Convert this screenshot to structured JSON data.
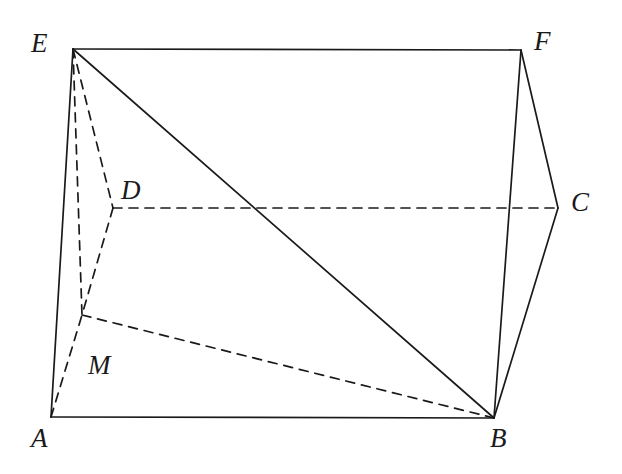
{
  "figure": {
    "type": "geometry-diagram",
    "canvas": {
      "width": 622,
      "height": 474,
      "background": "#ffffff"
    },
    "stroke_color": "#1a1a1a",
    "solid_stroke_width": 1.7,
    "dashed_stroke_width": 1.7,
    "dash_pattern": "9,7",
    "vertices": [
      {
        "id": "E",
        "label": "E",
        "x": 73,
        "y": 49,
        "label_x": 31,
        "label_y": 30,
        "hidden": false
      },
      {
        "id": "F",
        "label": "F",
        "x": 521,
        "y": 50,
        "label_x": 534,
        "label_y": 28,
        "hidden": false
      },
      {
        "id": "D",
        "label": "D",
        "x": 113,
        "y": 208,
        "label_x": 121,
        "label_y": 177,
        "hidden": true
      },
      {
        "id": "C",
        "label": "C",
        "x": 558,
        "y": 208,
        "label_x": 571,
        "label_y": 189,
        "hidden": false
      },
      {
        "id": "A",
        "label": "A",
        "x": 51,
        "y": 417,
        "label_x": 31,
        "label_y": 425,
        "hidden": false
      },
      {
        "id": "B",
        "label": "B",
        "x": 494,
        "y": 418,
        "label_x": 490,
        "label_y": 425,
        "hidden": false
      },
      {
        "id": "M",
        "label": "M",
        "x": 82,
        "y": 315,
        "label_x": 88,
        "label_y": 352,
        "hidden": true
      }
    ],
    "edges": [
      {
        "from": "E",
        "to": "F",
        "style": "solid",
        "name": "edge-EF"
      },
      {
        "from": "E",
        "to": "A",
        "style": "solid",
        "name": "edge-EA"
      },
      {
        "from": "E",
        "to": "B",
        "style": "solid",
        "name": "edge-EB"
      },
      {
        "from": "F",
        "to": "C",
        "style": "solid",
        "name": "edge-FC"
      },
      {
        "from": "F",
        "to": "B",
        "style": "solid",
        "name": "edge-FB"
      },
      {
        "from": "C",
        "to": "B",
        "style": "solid",
        "name": "edge-CB"
      },
      {
        "from": "A",
        "to": "B",
        "style": "solid",
        "name": "edge-AB"
      },
      {
        "from": "E",
        "to": "D",
        "style": "dashed",
        "name": "edge-ED"
      },
      {
        "from": "E",
        "to": "M",
        "style": "dashed",
        "name": "edge-EM"
      },
      {
        "from": "D",
        "to": "M",
        "style": "dashed",
        "name": "edge-DM"
      },
      {
        "from": "D",
        "to": "C",
        "style": "dashed",
        "name": "edge-DC"
      },
      {
        "from": "A",
        "to": "M",
        "style": "dashed",
        "name": "edge-AM"
      },
      {
        "from": "M",
        "to": "B",
        "style": "dashed",
        "name": "edge-MB"
      }
    ]
  }
}
